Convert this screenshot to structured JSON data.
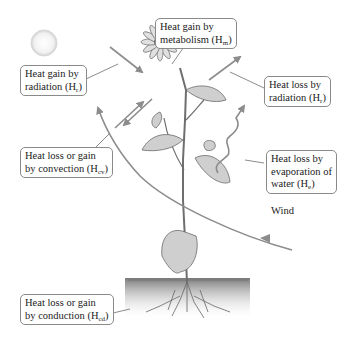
{
  "diagram": {
    "labels": {
      "metabolism": {
        "line1": "Heat gain by",
        "line2_main": "metabolism (H",
        "line2_sub": "m",
        "line2_end": ")"
      },
      "radiation_gain": {
        "line1": "Heat gain by",
        "line2_main": "radiation (H",
        "line2_sub": "r",
        "line2_end": ")"
      },
      "radiation_loss": {
        "line1": "Heat loss by",
        "line2_main": "radiation (H",
        "line2_sub": "r",
        "line2_end": ")"
      },
      "convection": {
        "line1": "Heat loss or gain",
        "line2_main": "by convection (H",
        "line2_sub": "cv",
        "line2_end": ")"
      },
      "evaporation": {
        "line1": "Heat loss by",
        "line2": "evaporation of",
        "line3_main": "water (H",
        "line3_sub": "e",
        "line3_end": ")"
      },
      "conduction": {
        "line1": "Heat loss or gain",
        "line2_main": "by conduction (H",
        "line2_sub": "cd",
        "line2_end": ")"
      },
      "wind": "Wind"
    },
    "colors": {
      "arrow": "#8c8c8c",
      "box_border": "#8a8a8a",
      "text": "#222222",
      "sun": "#e6e6e6",
      "soil": "#9a9a9a",
      "stem": "#6e6e6e"
    }
  }
}
